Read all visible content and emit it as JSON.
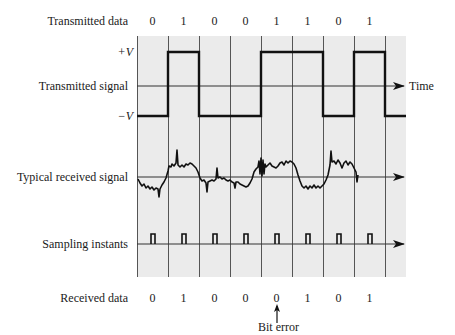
{
  "row_labels": {
    "transmitted_data": "Transmitted data",
    "plus_v": "+V",
    "transmitted_signal": "Transmitted signal",
    "minus_v": "−V",
    "received_signal": "Typical received signal",
    "sampling_instants": "Sampling instants",
    "received_data": "Received data"
  },
  "axis_label": "Time",
  "annotation": "Bit error",
  "transmitted_bits": [
    "0",
    "1",
    "0",
    "0",
    "1",
    "1",
    "0",
    "1"
  ],
  "received_bits": [
    "0",
    "1",
    "0",
    "0",
    "0",
    "1",
    "0",
    "1"
  ],
  "bit_error_index": 4,
  "colors": {
    "grid_bg": "#e9e9e9",
    "grid_line": "#555555",
    "signal": "#111111"
  }
}
